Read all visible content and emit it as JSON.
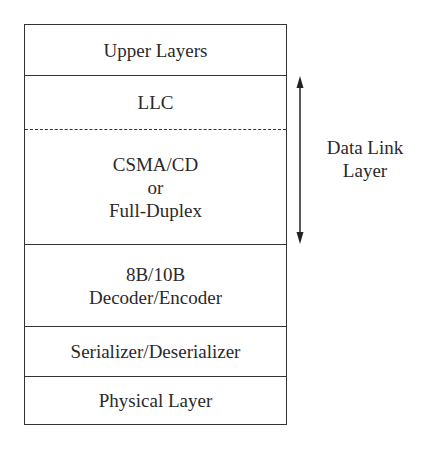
{
  "diagram": {
    "layers": [
      {
        "id": "upper-layers",
        "lines": [
          "Upper Layers"
        ]
      },
      {
        "id": "llc",
        "lines": [
          "LLC"
        ]
      },
      {
        "id": "csma-cd",
        "lines": [
          "CSMA/CD",
          "or",
          "Full-Duplex"
        ]
      },
      {
        "id": "encoder",
        "lines": [
          "8B/10B",
          "Decoder/Encoder"
        ]
      },
      {
        "id": "serdes",
        "lines": [
          "Serializer/Deserializer"
        ]
      },
      {
        "id": "physical",
        "lines": [
          "Physical Layer"
        ]
      }
    ],
    "bracket_label": {
      "lines": [
        "Data Link",
        "Layer"
      ]
    },
    "colors": {
      "line": "#333333",
      "text": "#2a2a2a",
      "background": "#ffffff"
    }
  }
}
